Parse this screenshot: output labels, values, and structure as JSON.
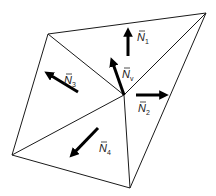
{
  "diagram": {
    "colors": {
      "edge": "#1a1a1a",
      "arrow": "#000000",
      "background": "#ffffff"
    },
    "vertices": {
      "center": [
        124,
        95
      ],
      "top_left": [
        48,
        34
      ],
      "top_right": [
        206,
        13
      ],
      "left": [
        12,
        155
      ],
      "bottom": [
        130,
        188
      ]
    },
    "edges": [
      [
        "top_left",
        "top_right"
      ],
      [
        "top_right",
        "bottom"
      ],
      [
        "bottom",
        "left"
      ],
      [
        "left",
        "top_left"
      ],
      [
        "center",
        "top_left"
      ],
      [
        "center",
        "top_right"
      ],
      [
        "center",
        "left"
      ],
      [
        "center",
        "bottom"
      ]
    ],
    "normals": [
      {
        "id": "N1",
        "symbol": "N",
        "subscript": "1",
        "from": [
          128,
          56
        ],
        "to": [
          128,
          28
        ],
        "label_pos": [
          137,
          41
        ]
      },
      {
        "id": "N2",
        "symbol": "N",
        "subscript": "2",
        "from": [
          136,
          95
        ],
        "to": [
          168,
          95
        ],
        "label_pos": [
          138,
          112
        ]
      },
      {
        "id": "N3",
        "symbol": "N",
        "subscript": "3",
        "from": [
          78,
          92
        ],
        "to": [
          45,
          72
        ],
        "label_pos": [
          64,
          84
        ]
      },
      {
        "id": "N4",
        "symbol": "N",
        "subscript": "4",
        "from": [
          98,
          128
        ],
        "to": [
          70,
          157
        ],
        "label_pos": [
          99,
          152
        ]
      },
      {
        "id": "Nv",
        "symbol": "N",
        "subscript": "v",
        "from": [
          124,
          95
        ],
        "to": [
          111,
          58
        ],
        "label_pos": [
          122,
          78
        ]
      }
    ]
  }
}
